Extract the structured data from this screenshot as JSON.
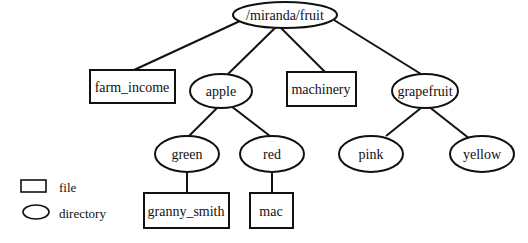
{
  "diagram": {
    "type": "directory-tree",
    "nodes": {
      "root": {
        "label": "/miranda/fruit",
        "kind": "directory"
      },
      "farm_income": {
        "label": "farm_income",
        "kind": "file"
      },
      "apple": {
        "label": "apple",
        "kind": "directory"
      },
      "machinery": {
        "label": "machinery",
        "kind": "file"
      },
      "grapefruit": {
        "label": "grapefruit",
        "kind": "directory"
      },
      "green": {
        "label": "green",
        "kind": "directory"
      },
      "red": {
        "label": "red",
        "kind": "directory"
      },
      "pink": {
        "label": "pink",
        "kind": "directory"
      },
      "yellow": {
        "label": "yellow",
        "kind": "directory"
      },
      "granny_smith": {
        "label": "granny_smith",
        "kind": "file"
      },
      "mac": {
        "label": "mac",
        "kind": "file"
      }
    },
    "edges": [
      [
        "root",
        "farm_income"
      ],
      [
        "root",
        "apple"
      ],
      [
        "root",
        "machinery"
      ],
      [
        "root",
        "grapefruit"
      ],
      [
        "apple",
        "green"
      ],
      [
        "apple",
        "red"
      ],
      [
        "grapefruit",
        "pink"
      ],
      [
        "grapefruit",
        "yellow"
      ],
      [
        "green",
        "granny_smith"
      ],
      [
        "red",
        "mac"
      ]
    ]
  },
  "legend": {
    "file": "file",
    "directory": "directory"
  }
}
